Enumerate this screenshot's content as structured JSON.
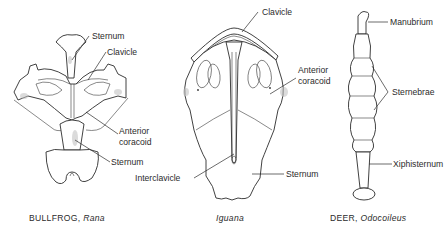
{
  "figure": {
    "panels": [
      {
        "id": "bullfrog",
        "caption_common": "BULLFROG,",
        "caption_genus": "Rana",
        "labels": [
          "Sternum",
          "Clavicle",
          "Anterior",
          "coracoid",
          "Sternum"
        ]
      },
      {
        "id": "iguana",
        "caption_common": "",
        "caption_genus": "Iguana",
        "labels": [
          "Clavicle",
          "Anterior",
          "coracoid",
          "Interclavicle",
          "Sternum"
        ]
      },
      {
        "id": "deer",
        "caption_common": "DEER,",
        "caption_genus": "Odocoileus",
        "labels": [
          "Manubrium",
          "Sternebrae",
          "Xiphisternum"
        ]
      }
    ]
  }
}
